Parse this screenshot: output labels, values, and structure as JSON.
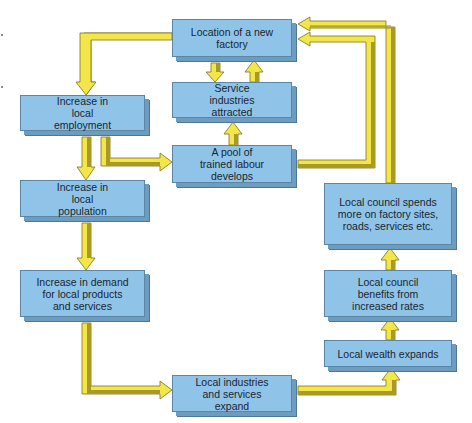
{
  "diagram": {
    "title": "",
    "colors": {
      "box_fill": "#8fc4e8",
      "box_edge": "#6e9cbf",
      "arrow_fill": "#f2e64a",
      "arrow_shade": "#a99a28",
      "text": "#1a2430"
    },
    "nodes": {
      "factory": "Location of a new factory",
      "service": "Service industries attracted",
      "employment": "Increase in local employment",
      "labour": "A pool of trained labour develops",
      "population": "Increase in local population",
      "demand": "Increase in demand for local products and services",
      "industries": "Local industries and services expand",
      "wealth": "Local wealth expands",
      "benefits": "Local council benefits from increased rates",
      "spends": "Local council spends more on factory sites, roads, services etc."
    },
    "edges": [
      {
        "from": "factory",
        "to": "employment"
      },
      {
        "from": "factory",
        "to": "service"
      },
      {
        "from": "service",
        "to": "factory"
      },
      {
        "from": "labour",
        "to": "service"
      },
      {
        "from": "employment",
        "to": "labour"
      },
      {
        "from": "employment",
        "to": "population"
      },
      {
        "from": "population",
        "to": "demand"
      },
      {
        "from": "demand",
        "to": "industries"
      },
      {
        "from": "industries",
        "to": "wealth"
      },
      {
        "from": "wealth",
        "to": "benefits"
      },
      {
        "from": "benefits",
        "to": "spends"
      },
      {
        "from": "spends",
        "to": "factory"
      },
      {
        "from": "labour",
        "to": "factory"
      }
    ]
  }
}
